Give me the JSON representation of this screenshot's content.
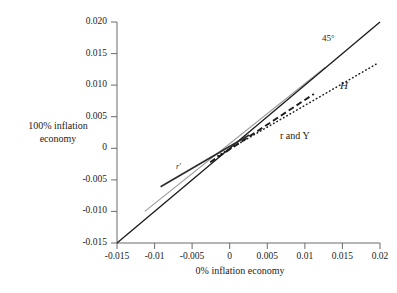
{
  "chart_data": {
    "type": "line",
    "title": "",
    "xlabel": "0% inflation economy",
    "ylabel": "100% inflation economy",
    "ylabel_line1": "100% inflation",
    "ylabel_line2": "economy",
    "xlim": [
      -0.015,
      0.02
    ],
    "ylim": [
      -0.015,
      0.02
    ],
    "grid": false,
    "legend_position": "inline-annotations",
    "xticks": [
      "-0.015",
      "-0.01",
      "-0.005",
      "0",
      "0.005",
      "0.01",
      "0.015",
      "0.02"
    ],
    "xtick_values": [
      -0.015,
      -0.01,
      -0.005,
      0,
      0.005,
      0.01,
      0.015,
      0.02
    ],
    "yticks": [
      "0.020",
      "0.015",
      "0.010",
      "0.005",
      "0",
      "-0.005",
      "-0.010",
      "-0.015"
    ],
    "ytick_values": [
      0.02,
      0.015,
      0.01,
      0.005,
      0,
      -0.005,
      -0.01,
      -0.015
    ],
    "annotations": [
      {
        "text": "45°",
        "x": 0.0135,
        "y": 0.0168
      },
      {
        "text": "H",
        "x": 0.0178,
        "y": 0.0104
      },
      {
        "text": "r and Y",
        "x": 0.0082,
        "y": 0.0042
      },
      {
        "text": "r′",
        "x": -0.0063,
        "y": -0.0031
      }
    ],
    "series": [
      {
        "name": "45°",
        "style": "solid",
        "color": "#1a1a1a",
        "width": 1.3,
        "x": [
          -0.015,
          0.02
        ],
        "values": [
          -0.015,
          0.02
        ]
      },
      {
        "name": "gray reference line",
        "style": "solid",
        "color": "#9a9a9a",
        "width": 1.1,
        "x": [
          -0.0113,
          0.0127
        ],
        "values": [
          -0.01,
          0.0128
        ]
      },
      {
        "name": "H",
        "style": "dotted",
        "color": "#1a1a1a",
        "width": 1.4,
        "x": [
          -0.0016,
          0.0196
        ],
        "values": [
          -0.0012,
          0.0134
        ]
      },
      {
        "name": "r and Y",
        "style": "dashed",
        "color": "#1a1a1a",
        "width": 1.8,
        "x": [
          -0.0026,
          0.0112
        ],
        "values": [
          -0.0022,
          0.0086
        ]
      },
      {
        "name": "r′",
        "style": "solid",
        "color": "#2b2b2b",
        "width": 1.6,
        "x": [
          -0.0092,
          0.0026
        ],
        "values": [
          -0.0061,
          0.0021
        ]
      }
    ],
    "axes_color": "#555555"
  }
}
